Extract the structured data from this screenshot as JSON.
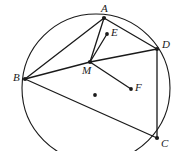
{
  "figure": {
    "type": "geometry-diagram",
    "width": 180,
    "height": 151,
    "colors": {
      "stroke": "#1a1a1a",
      "background": "#ffffff",
      "label": "#1a1a1a"
    },
    "circle": {
      "name": "main-circle",
      "cx": 96,
      "cy": 88,
      "r": 74,
      "stroke_width": 1.1
    },
    "points": [
      {
        "id": "A",
        "label": "A",
        "x": 104,
        "y": 18,
        "dot": true,
        "dot_r": 2.1,
        "label_x": 101,
        "label_y": 3,
        "on_circle": true
      },
      {
        "id": "D",
        "label": "D",
        "x": 157,
        "y": 49,
        "dot": true,
        "dot_r": 2.1,
        "label_x": 162,
        "label_y": 39,
        "on_circle": true
      },
      {
        "id": "B",
        "label": "B",
        "x": 25,
        "y": 79,
        "dot": true,
        "dot_r": 2.1,
        "label_x": 13,
        "label_y": 72,
        "on_circle": true
      },
      {
        "id": "C",
        "label": "C",
        "x": 157,
        "y": 138,
        "dot": true,
        "dot_r": 2.1,
        "label_x": 161,
        "label_y": 138,
        "on_circle": true
      },
      {
        "id": "M",
        "label": "M",
        "x": 90,
        "y": 62,
        "dot": true,
        "dot_r": 2.1,
        "label_x": 82,
        "label_y": 65,
        "on_circle": false
      },
      {
        "id": "E",
        "label": "E",
        "x": 107,
        "y": 34,
        "dot": true,
        "dot_r": 1.9,
        "label_x": 111,
        "label_y": 27,
        "on_circle": false
      },
      {
        "id": "F",
        "label": "F",
        "x": 131,
        "y": 89,
        "dot": true,
        "dot_r": 1.9,
        "label_x": 135,
        "label_y": 82,
        "on_circle": false
      },
      {
        "id": "O",
        "label": "",
        "x": 95,
        "y": 95,
        "dot": true,
        "dot_r": 1.9,
        "label_x": 0,
        "label_y": 0,
        "on_circle": false
      }
    ],
    "segments": [
      {
        "name": "segment-B-A",
        "from": "B",
        "to": "A",
        "x1": 25,
        "y1": 79,
        "x2": 104,
        "y2": 18,
        "stroke_width": 1.3
      },
      {
        "name": "segment-A-D",
        "from": "A",
        "to": "D",
        "x1": 104,
        "y1": 18,
        "x2": 157,
        "y2": 49,
        "stroke_width": 1.3
      },
      {
        "name": "segment-D-C",
        "from": "D",
        "to": "C",
        "x1": 157,
        "y1": 49,
        "x2": 157,
        "y2": 138,
        "stroke_width": 1.3
      },
      {
        "name": "segment-B-C",
        "from": "B",
        "to": "C",
        "x1": 25,
        "y1": 79,
        "x2": 157,
        "y2": 138,
        "stroke_width": 1.3
      },
      {
        "name": "segment-B-M",
        "from": "B",
        "to": "M",
        "x1": 25,
        "y1": 79,
        "x2": 90,
        "y2": 62,
        "stroke_width": 1.3
      },
      {
        "name": "segment-M-D",
        "from": "M",
        "to": "D",
        "x1": 90,
        "y1": 62,
        "x2": 157,
        "y2": 49,
        "stroke_width": 1.3
      },
      {
        "name": "segment-M-A",
        "from": "M",
        "to": "A",
        "x1": 90,
        "y1": 62,
        "x2": 104,
        "y2": 18,
        "stroke_width": 1.3
      },
      {
        "name": "segment-M-E",
        "from": "M",
        "to": "E",
        "x1": 90,
        "y1": 62,
        "x2": 107,
        "y2": 34,
        "stroke_width": 1.3
      },
      {
        "name": "segment-M-F",
        "from": "M",
        "to": "F",
        "x1": 90,
        "y1": 62,
        "x2": 131,
        "y2": 89,
        "stroke_width": 1.3
      }
    ]
  }
}
